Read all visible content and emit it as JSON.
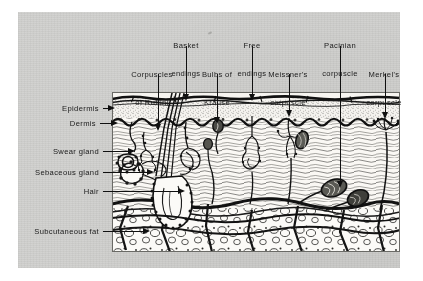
{
  "figure": {
    "panel_background": "#cfcfcd",
    "ink_color": "#101010"
  },
  "top_labels": [
    {
      "name": "basket-endings",
      "line1": "Basket",
      "line2": "endings",
      "x": 186,
      "y": 24,
      "leader_x": 186,
      "leader_y1": 46,
      "leader_y2": 99
    },
    {
      "name": "free-endings",
      "line1": "Free",
      "line2": "endings",
      "x": 252,
      "y": 24,
      "leader_x": 252,
      "leader_y1": 46,
      "leader_y2": 99
    },
    {
      "name": "pacinian-corpuscle",
      "line1": "Pacinian",
      "line2": "corpuscle",
      "x": 340,
      "y": 24,
      "leader_x": 340,
      "leader_y1": 46,
      "leader_y2": 186
    },
    {
      "name": "corpuscles-of-ruffini",
      "line1": "Corpuscles",
      "line2": "of Ruffini",
      "x": 150,
      "y": 53,
      "leader_x": 158,
      "leader_y1": 74,
      "leader_y2": 129
    },
    {
      "name": "bulbs-of-krause",
      "line1": "Bulbs of",
      "line2": "Krause",
      "x": 214,
      "y": 53,
      "leader_x": 217,
      "leader_y1": 74,
      "leader_y2": 122
    },
    {
      "name": "meissners-corpuscle",
      "line1": "Meissner's",
      "line2": "corpuscle",
      "x": 288,
      "y": 53,
      "leader_x": 289,
      "leader_y1": 74,
      "leader_y2": 115
    },
    {
      "name": "merkels-corpuscle",
      "line1": "Merkel's",
      "line2": "corpuscle",
      "x": 384,
      "y": 53,
      "leader_x": 385,
      "leader_y1": 74,
      "leader_y2": 117
    }
  ],
  "left_labels": [
    {
      "name": "epidermis",
      "text": "Epidermis",
      "x": 98,
      "y": 105,
      "leader_x1": 103,
      "leader_x2": 113,
      "leader_y": 108
    },
    {
      "name": "dermis",
      "text": "Dermis",
      "x": 98,
      "y": 120,
      "leader_x1": 100,
      "leader_x2": 116,
      "leader_y": 123
    },
    {
      "name": "swear-gland",
      "text": "Swear gland",
      "x": 98,
      "y": 148,
      "leader_x1": 103,
      "leader_x2": 133,
      "leader_y": 151
    },
    {
      "name": "sebaceous-gland",
      "text": "Sebaceous gland",
      "x": 98,
      "y": 169,
      "leader_x1": 103,
      "leader_x2": 152,
      "leader_y": 172
    },
    {
      "name": "hair",
      "text": "Hair",
      "x": 98,
      "y": 188,
      "leader_x1": 103,
      "leader_x2": 183,
      "leader_y": 191
    },
    {
      "name": "subcutaneous-fat",
      "text": "Subcutaneous fat",
      "x": 98,
      "y": 228,
      "leader_x1": 103,
      "leader_x2": 148,
      "leader_y": 231
    }
  ],
  "layers": [
    {
      "name": "epidermis-layer",
      "depth_label": "Epidermis"
    },
    {
      "name": "dermis-layer",
      "depth_label": "Dermis"
    },
    {
      "name": "subcutaneous-fat-layer",
      "depth_label": "Subcutaneous fat"
    }
  ]
}
